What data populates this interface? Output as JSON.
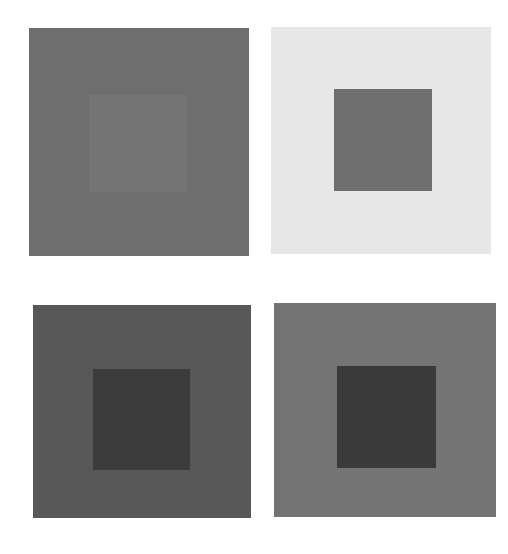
{
  "figure": {
    "panels": [
      {
        "id": "top-left",
        "outer": {
          "x": 29,
          "y": 28,
          "w": 220,
          "h": 228,
          "color": "#6e6e6e"
        },
        "inner": {
          "x": 89,
          "y": 95,
          "w": 98,
          "h": 97,
          "color": "#747474"
        }
      },
      {
        "id": "top-right",
        "outer": {
          "x": 271,
          "y": 27,
          "w": 220,
          "h": 227,
          "color": "#e7e7e7"
        },
        "inner": {
          "x": 334,
          "y": 89,
          "w": 98,
          "h": 102,
          "color": "#6f6f6f"
        }
      },
      {
        "id": "bottom-left",
        "outer": {
          "x": 33,
          "y": 305,
          "w": 218,
          "h": 213,
          "color": "#575757"
        },
        "inner": {
          "x": 93,
          "y": 369,
          "w": 97,
          "h": 101,
          "color": "#3b3b3b"
        }
      },
      {
        "id": "bottom-right",
        "outer": {
          "x": 274,
          "y": 303,
          "w": 222,
          "h": 214,
          "color": "#747474"
        },
        "inner": {
          "x": 337,
          "y": 366,
          "w": 99,
          "h": 102,
          "color": "#3a3a3a"
        }
      }
    ]
  }
}
